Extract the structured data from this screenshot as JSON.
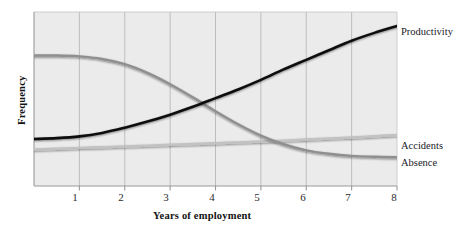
{
  "figure": {
    "name": "employment-outcomes-line-chart",
    "background_color": "#ffffff",
    "plot_background_color": "#ebebeb",
    "plot_border_color": "#9a9a9a",
    "gridline_color": "#b9b9b9"
  },
  "chart_data": {
    "type": "line",
    "title": "",
    "subtitle": "",
    "xlabel": "Years of employment",
    "ylabel": "Frequency",
    "xlim": [
      0,
      8
    ],
    "ylim": [
      0,
      100
    ],
    "xticks": [
      1,
      2,
      3,
      4,
      5,
      6,
      7,
      8
    ],
    "xtick_labels": [
      "1",
      "2",
      "3",
      "4",
      "5",
      "6",
      "7",
      "8"
    ],
    "yticks": [],
    "ytick_labels": [],
    "grid": true,
    "grid_axis": "x",
    "legend": "inline-right-of-curve-ends",
    "x": [
      0,
      0.5,
      1,
      1.5,
      2,
      2.5,
      3,
      3.5,
      4,
      4.5,
      5,
      5.5,
      6,
      6.5,
      7,
      7.5,
      8
    ],
    "series": [
      {
        "name": "Productivity",
        "color": "#101010",
        "width": 2.6,
        "label_position": "end",
        "values": [
          27,
          27.5,
          28.5,
          30.5,
          33.5,
          37,
          41,
          45.5,
          50.5,
          55.5,
          61,
          67,
          72.5,
          78,
          83.5,
          88,
          92
        ]
      },
      {
        "name": "Accidents",
        "color": "#c2c2c2",
        "width": 2.4,
        "label_position": "end",
        "values": [
          21,
          21.4,
          21.9,
          22.3,
          22.8,
          23.2,
          23.7,
          24.1,
          24.6,
          25.1,
          25.6,
          26.1,
          26.7,
          27.3,
          27.9,
          28.6,
          29.3
        ]
      },
      {
        "name": "Absence",
        "color": "#8f8f8f",
        "width": 2.4,
        "label_position": "end",
        "values": [
          75,
          75,
          74.5,
          73,
          70,
          65,
          58.5,
          51,
          43,
          35.5,
          29,
          24,
          20.5,
          18.5,
          17.3,
          16.8,
          16.5
        ]
      }
    ]
  },
  "labels": {
    "productivity": "Productivity",
    "accidents": "Accidents",
    "absence": "Absence",
    "x_axis_title": "Years of employment",
    "y_axis_title": "Frequency",
    "tick_1": "1",
    "tick_2": "2",
    "tick_3": "3",
    "tick_4": "4",
    "tick_5": "5",
    "tick_6": "6",
    "tick_7": "7",
    "tick_8": "8"
  }
}
